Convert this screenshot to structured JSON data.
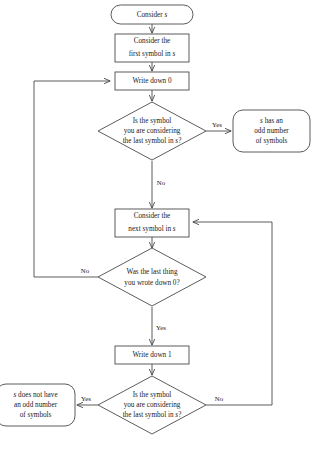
{
  "diagram": {
    "type": "flowchart",
    "colors": {
      "stroke": "#4a4a4a",
      "text": "#1a1a1a",
      "background": "#ffffff"
    },
    "nodes": {
      "start": {
        "shape": "terminator",
        "lines": [
          "Consider s"
        ],
        "italic_tokens": [
          "s"
        ]
      },
      "first_symbol": {
        "shape": "process",
        "lines": [
          "Consider the",
          "first symbol in s"
        ]
      },
      "write_zero": {
        "shape": "process",
        "lines": [
          "Write down 0"
        ]
      },
      "decision_last_symbol_top": {
        "shape": "decision",
        "lines": [
          "Is the symbol",
          "you are considering",
          "the last symbol in s?"
        ]
      },
      "odd_result": {
        "shape": "terminator",
        "lines": [
          "s has an",
          "odd number",
          "of symbols"
        ]
      },
      "next_symbol": {
        "shape": "process",
        "lines": [
          "Consider the",
          "next symbol in s"
        ]
      },
      "decision_wrote_zero": {
        "shape": "decision",
        "lines": [
          "Was the last thing",
          "you wrote down 0?"
        ]
      },
      "write_one": {
        "shape": "process",
        "lines": [
          "Write down 1"
        ]
      },
      "decision_last_symbol_bottom": {
        "shape": "decision",
        "lines": [
          "Is the symbol",
          "you are considering",
          "the last symbol in s?"
        ]
      },
      "not_odd_result": {
        "shape": "terminator",
        "lines": [
          "s does not have",
          "an odd number",
          "of symbols"
        ]
      }
    },
    "edge_labels": {
      "top_yes": "Yes",
      "top_no": "No",
      "wrote_zero_no": "No",
      "wrote_zero_yes": "Yes",
      "bottom_yes": "Yes",
      "bottom_no": "No"
    }
  }
}
